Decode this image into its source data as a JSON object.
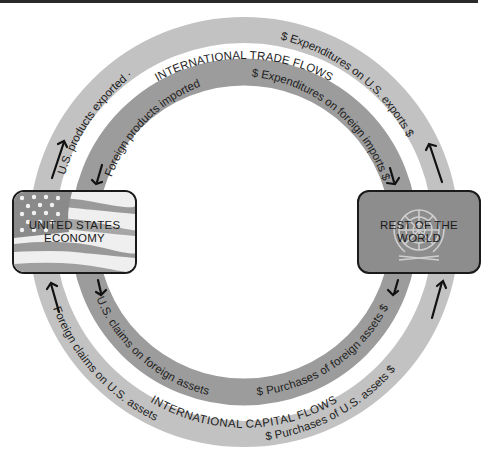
{
  "colors": {
    "outer_ring": "#c2c2c2",
    "inner_ring": "#9c9c9c",
    "world_box": "#8d8d8d",
    "text": "#1e1e1e"
  },
  "nodes": {
    "us": {
      "label_line1": "UNITED STATES",
      "label_line2": "ECONOMY",
      "icon": "us-flag-icon"
    },
    "world": {
      "label_line1": "REST OF THE",
      "label_line2": "WORLD",
      "icon": "un-emblem-icon"
    }
  },
  "headings": {
    "trade": "INTERNATIONAL TRADE FLOWS",
    "capital": "INTERNATIONAL CAPITAL FLOWS"
  },
  "flows": {
    "outer_top_left": "U.S. products exported  ·",
    "outer_top_right": "$ Expenditures on U.S. exports $",
    "inner_top_left": "Foreign products imported",
    "inner_top_right": "$ Expenditures on foreign imports $",
    "inner_bottom_left": "U.S. claims on foreign assets",
    "inner_bottom_right": "$ Purchases of foreign assets $",
    "outer_bottom_left": "Foreign claims on U.S. assets",
    "outer_bottom_right": "$ Purchases of U.S. assets $"
  }
}
